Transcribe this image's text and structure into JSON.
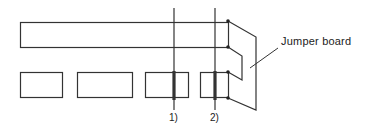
{
  "diagram": {
    "colors": {
      "line": "#333333",
      "background": "#ffffff"
    },
    "labels": {
      "jumper_board": "Jumper board",
      "cut_1": "1)",
      "cut_2": "2)"
    },
    "elements": {
      "top_bar": {
        "x": 20,
        "y": 22,
        "w": 208,
        "h": 25
      },
      "bottom_blocks": [
        {
          "x": 20,
          "y": 72,
          "w": 42,
          "h": 25
        },
        {
          "x": 77,
          "y": 72,
          "w": 55,
          "h": 25
        },
        {
          "x": 145,
          "y": 72,
          "w": 43,
          "h": 25
        },
        {
          "x": 200,
          "y": 72,
          "w": 28,
          "h": 25
        }
      ],
      "cut_lines": [
        {
          "label": "1)",
          "x": 174
        },
        {
          "label": "2)",
          "x": 215
        }
      ]
    }
  }
}
